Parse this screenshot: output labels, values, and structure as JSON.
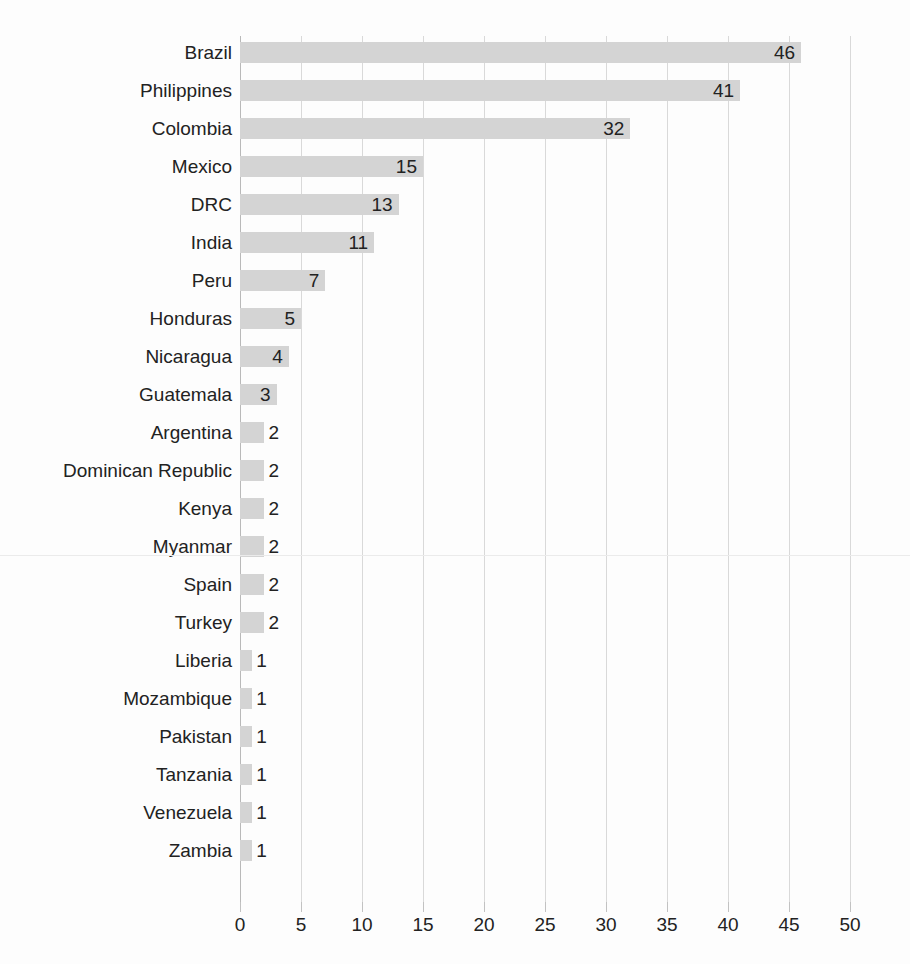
{
  "chart_data": {
    "type": "bar",
    "orientation": "horizontal",
    "title": "",
    "subtitle": "",
    "xlabel": "",
    "ylabel": "",
    "xlim": [
      0,
      50
    ],
    "xticks": [
      0,
      5,
      10,
      15,
      20,
      25,
      30,
      35,
      40,
      45,
      50
    ],
    "grid": true,
    "legend": false,
    "legend_position": "none",
    "bar_color": "#d4d4d4",
    "text_color": "#222222",
    "gridline_color": "#d9d9d9",
    "background": "#fdfdfd",
    "categories": [
      "Brazil",
      "Philippines",
      "Colombia",
      "Mexico",
      "DRC",
      "India",
      "Peru",
      "Honduras",
      "Nicaragua",
      "Guatemala",
      "Argentina",
      "Dominican Republic",
      "Kenya",
      "Myanmar",
      "Spain",
      "Turkey",
      "Liberia",
      "Mozambique",
      "Pakistan",
      "Tanzania",
      "Venezuela",
      "Zambia"
    ],
    "values": [
      46,
      41,
      32,
      15,
      13,
      11,
      7,
      5,
      4,
      3,
      2,
      2,
      2,
      2,
      2,
      2,
      1,
      1,
      1,
      1,
      1,
      1
    ],
    "data_labels": [
      "46",
      "41",
      "32",
      "15",
      "13",
      "11",
      "7",
      "5",
      "4",
      "3",
      "2",
      "2",
      "2",
      "2",
      "2",
      "2",
      "1",
      "1",
      "1",
      "1",
      "1",
      "1"
    ],
    "tick_labels": [
      "0",
      "5",
      "10",
      "15",
      "20",
      "25",
      "30",
      "35",
      "40",
      "45",
      "50"
    ]
  }
}
